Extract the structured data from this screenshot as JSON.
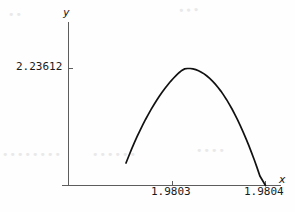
{
  "figure": {
    "axis_label_y": "y",
    "axis_label_x": "x"
  },
  "chart_data": {
    "type": "line",
    "title": "",
    "xlabel": "x",
    "ylabel": "y",
    "grid": false,
    "legend": null,
    "xlim": [
      1.98025,
      1.98042
    ],
    "ylim": [
      0,
      2.4
    ],
    "xticks": [
      1.9803,
      1.9804
    ],
    "xtick_labels": [
      "1.9803",
      "1.9804"
    ],
    "yticks": [
      2.23612
    ],
    "ytick_labels": [
      "2.23612"
    ],
    "annotations": [],
    "series": [
      {
        "name": "curve",
        "comment": "Downward-opening arch; rises from the y-axis, peaks at the 2.23612 level, then falls to zero at x = 1.9804",
        "x": [
          1.98025,
          1.980253,
          1.980256,
          1.980259,
          1.980262,
          1.980265,
          1.980268,
          1.980271,
          1.980274,
          1.980277,
          1.98028,
          1.980283,
          1.980286,
          1.980289,
          1.980292,
          1.980295,
          1.980298,
          1.980301,
          1.980304,
          1.980307,
          1.98031,
          1.980313,
          1.980316,
          1.980319,
          1.980322,
          1.980325,
          1.980328,
          1.980331,
          1.980334,
          1.980337,
          1.98034,
          1.980343,
          1.980346,
          1.980349,
          1.980352,
          1.980355,
          1.980358,
          1.980361,
          1.980364,
          1.980367,
          1.98037,
          1.980373,
          1.980376,
          1.980379,
          1.980382,
          1.980385,
          1.980388,
          1.980391,
          1.980394,
          1.980397,
          1.9804
        ],
        "y": [
          0.43,
          0.565,
          0.695,
          0.82,
          0.938,
          1.05,
          1.158,
          1.262,
          1.36,
          1.454,
          1.544,
          1.629,
          1.71,
          1.787,
          1.859,
          1.927,
          1.991,
          2.05,
          2.105,
          2.155,
          2.2,
          2.228,
          2.236,
          2.236,
          2.228,
          2.214,
          2.193,
          2.166,
          2.133,
          2.093,
          2.048,
          1.996,
          1.938,
          1.874,
          1.804,
          1.727,
          1.645,
          1.556,
          1.462,
          1.361,
          1.254,
          1.141,
          1.022,
          0.897,
          0.766,
          0.629,
          0.486,
          0.337,
          0.181,
          0.09,
          0.0
        ]
      }
    ],
    "peak": {
      "x": 1.98032,
      "y": 2.23612
    },
    "y_intercept": 0.43,
    "x_zero_crossing": 1.9804
  },
  "paper_artifacts": {
    "bleed_a": "••••••••",
    "bleed_b": "••••••",
    "bleed_c": "••••",
    "bleed_d": "•••",
    "bleed_e": "••"
  }
}
